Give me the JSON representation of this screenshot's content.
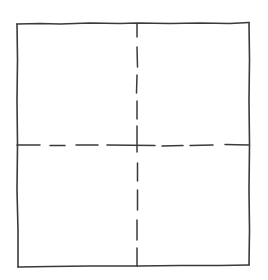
{
  "diagram": {
    "stroke_color": "#3a3a3a",
    "background": "#ffffff",
    "outer_square": {
      "top_left": [
        17,
        24
      ],
      "top_right": [
        249,
        22
      ],
      "bottom_right": [
        249,
        265
      ],
      "bottom_left": [
        18,
        267
      ]
    },
    "vertical_divider": {
      "x": 137,
      "style": "dashed",
      "dashes": [
        [
          24,
          37
        ],
        [
          47,
          67
        ],
        [
          75,
          93
        ],
        [
          101,
          119
        ],
        [
          126,
          152
        ],
        [
          163,
          181
        ],
        [
          190,
          210
        ],
        [
          220,
          240
        ],
        [
          248,
          266
        ]
      ]
    },
    "horizontal_divider": {
      "y": 145,
      "style": "dashed",
      "dashes": [
        [
          17,
          40
        ],
        [
          50,
          65
        ],
        [
          76,
          98
        ],
        [
          107,
          133
        ],
        [
          133,
          155
        ],
        [
          162,
          183
        ],
        [
          190,
          213
        ],
        [
          225,
          249
        ]
      ]
    }
  }
}
